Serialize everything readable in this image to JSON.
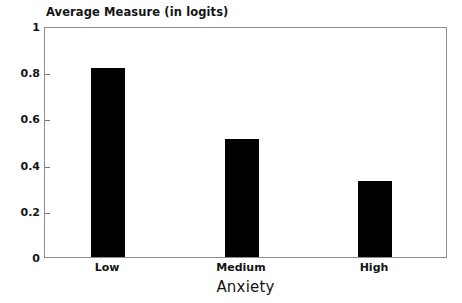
{
  "chart_data": {
    "type": "bar",
    "title": "Average Measure (in logits)",
    "xlabel": "Anxiety",
    "ylabel": "",
    "categories": [
      "Low",
      "Medium",
      "High"
    ],
    "values": [
      0.82,
      0.51,
      0.33
    ],
    "ylim": [
      0,
      1
    ],
    "yticks": [
      "0",
      "0.2",
      "0.4",
      "0.6",
      "0.8",
      "1"
    ],
    "ytick_values": [
      0,
      0.2,
      0.4,
      0.6,
      0.8,
      1
    ],
    "grid": false,
    "legend": "none",
    "bar_color": "#000000",
    "frame_color": "#8c8c8c",
    "background": "#ffffff"
  }
}
